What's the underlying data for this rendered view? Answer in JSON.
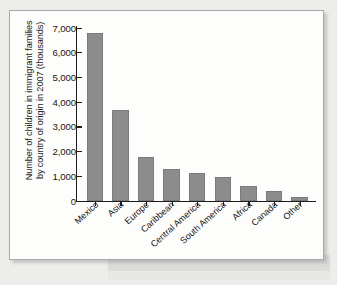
{
  "figure": {
    "panel_name": "bar-chart-figure"
  },
  "chart_data": {
    "type": "bar",
    "title": "",
    "subtitle": "",
    "xlabel": "",
    "ylabel": "Number of children in immigrant families by country of origin in 2007 (thousands)",
    "ylabel_lines": [
      "Number of children in immigrant families",
      "by country of origin in 2007 (thousands)"
    ],
    "categories": [
      "Mexico",
      "Asia",
      "Europe",
      "Caribbean",
      "Central America",
      "South America",
      "Africa",
      "Canada",
      "Other"
    ],
    "values": [
      6780,
      3670,
      1750,
      1260,
      1100,
      950,
      590,
      390,
      150
    ],
    "ylim": [
      0,
      7000
    ],
    "ytick_values": [
      0,
      1000,
      2000,
      3000,
      4000,
      5000,
      6000,
      7000
    ],
    "ytick_labels": [
      "0",
      "1,000",
      "2,000",
      "3,000",
      "4,000",
      "5,000",
      "6,000",
      "7,000"
    ],
    "grid": false,
    "legend": false,
    "bar_color": "#8c8c8c",
    "axis_color": "#1d1d1d",
    "category_label_rotation": -42
  },
  "colors": {
    "page_background": "#ededeb",
    "panel_background": "#fdfdfc",
    "panel_border": "#a9a9a9",
    "bar_fill": "#8c8c8c",
    "bar_stroke": "#7b7b7b",
    "text": "#151515"
  }
}
